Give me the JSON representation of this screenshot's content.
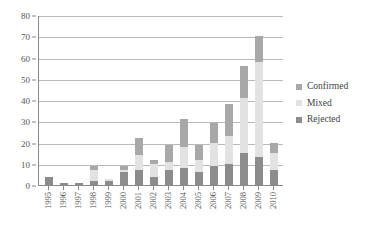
{
  "chart_data": {
    "type": "bar",
    "stacked": true,
    "title": "",
    "subtitle": "",
    "xlabel": "",
    "ylabel": "",
    "ylim": [
      0,
      80
    ],
    "ytick_step": 10,
    "yticks": [
      0,
      10,
      20,
      30,
      40,
      50,
      60,
      70,
      80
    ],
    "ytick_labels": [
      "0",
      "10",
      "20",
      "30",
      "40",
      "50",
      "60",
      "70",
      "80"
    ],
    "grid": true,
    "grid_axis": "y",
    "legend_position": "right",
    "stack_order_bottom_to_top": [
      "Rejected",
      "Mixed",
      "Confirmed"
    ],
    "categories": [
      "1995",
      "1996",
      "1997",
      "1998",
      "1999",
      "2000",
      "2001",
      "2002",
      "2003",
      "2004",
      "2005",
      "2006",
      "2007",
      "2008",
      "2009",
      "2010"
    ],
    "series": [
      {
        "name": "Confirmed",
        "color": "#a8a8a8",
        "values": [
          0,
          0,
          0,
          2,
          0,
          2,
          8,
          2,
          8,
          13,
          7,
          9,
          15,
          15,
          12,
          5
        ]
      },
      {
        "name": "Mixed",
        "color": "#e2e2e2",
        "values": [
          0,
          0,
          0,
          5,
          1,
          1,
          7,
          6,
          4,
          10,
          6,
          11,
          13,
          26,
          45,
          8
        ]
      },
      {
        "name": "Rejected",
        "color": "#8c8c8c",
        "values": [
          4,
          1,
          1,
          2,
          2,
          6,
          7,
          4,
          7,
          8,
          6,
          9,
          10,
          15,
          13,
          7
        ]
      }
    ],
    "totals": [
      4,
      1,
      1,
      9,
      3,
      9,
      22,
      12,
      19,
      31,
      19,
      29,
      38,
      56,
      70,
      20
    ]
  },
  "legend": {
    "items": [
      {
        "label": "Confirmed",
        "color": "#a8a8a8"
      },
      {
        "label": "Mixed",
        "color": "#e2e2e2"
      },
      {
        "label": "Rejected",
        "color": "#8c8c8c"
      }
    ]
  },
  "colors": {
    "axis": "#8a8a8a",
    "gridline": "#b9b9b9",
    "background": "#ffffff",
    "tick_text": "#555555",
    "legend_text": "#3f3f3f"
  }
}
